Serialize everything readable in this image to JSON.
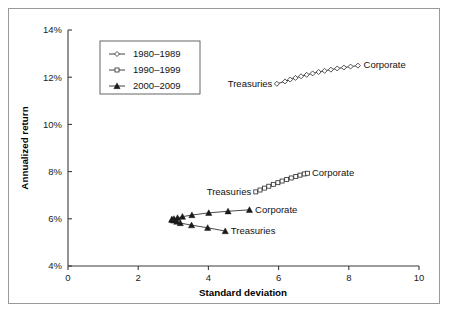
{
  "chart_data": {
    "type": "scatter",
    "title": "",
    "xlabel": "Standard deviation",
    "ylabel": "Annualized return",
    "xlim": [
      0,
      10
    ],
    "ylim": [
      4,
      14
    ],
    "xticks": [
      "0",
      "2",
      "4",
      "6",
      "8",
      "10"
    ],
    "xtick_values": [
      0,
      2,
      4,
      6,
      8,
      10
    ],
    "yticks": [
      "4%",
      "6%",
      "8%",
      "10%",
      "12%",
      "14%"
    ],
    "ytick_values": [
      4,
      6,
      8,
      10,
      12,
      14
    ],
    "grid": false,
    "legend_position": "upper left",
    "legend_entries": [
      "1980–1989",
      "1990–1999",
      "2000–2009"
    ],
    "series": [
      {
        "name": "1980–1989",
        "marker": "diamond-open",
        "start_label": "Treasuries",
        "end_label": "Corporate",
        "x": [
          5.95,
          6.18,
          6.33,
          6.48,
          6.64,
          6.8,
          6.97,
          7.14,
          7.31,
          7.49,
          7.67,
          7.86,
          8.05,
          8.26
        ],
        "y": [
          11.72,
          11.82,
          11.9,
          11.97,
          12.04,
          12.1,
          12.16,
          12.22,
          12.27,
          12.32,
          12.37,
          12.41,
          12.45,
          12.49
        ]
      },
      {
        "name": "1990–1999",
        "marker": "square-open",
        "start_label": "Treasuries",
        "end_label": "Corporate",
        "x": [
          5.35,
          5.47,
          5.6,
          5.72,
          5.85,
          5.98,
          6.1,
          6.23,
          6.36,
          6.49,
          6.61,
          6.73,
          6.82
        ],
        "y": [
          7.14,
          7.22,
          7.3,
          7.38,
          7.46,
          7.53,
          7.6,
          7.67,
          7.73,
          7.79,
          7.85,
          7.9,
          7.93
        ]
      },
      {
        "name": "2000–2009 Corporate",
        "marker": "triangle-solid",
        "start_label": "",
        "end_label": "Corporate",
        "x": [
          2.96,
          3.02,
          3.12,
          3.26,
          3.53,
          4.01,
          4.56,
          5.17
        ],
        "y": [
          5.97,
          6.0,
          6.04,
          6.09,
          6.16,
          6.25,
          6.32,
          6.38
        ]
      },
      {
        "name": "2000–2009 Treasuries",
        "marker": "triangle-solid",
        "start_label": "",
        "end_label": "Treasuries",
        "x": [
          2.96,
          3.01,
          3.1,
          3.2,
          3.52,
          3.98,
          4.48
        ],
        "y": [
          5.97,
          5.93,
          5.88,
          5.82,
          5.73,
          5.62,
          5.48
        ]
      }
    ],
    "annotations": [
      {
        "text": "Treasuries",
        "series": "1980–1989",
        "anchor": "end",
        "x": 5.82,
        "y": 11.72
      },
      {
        "text": "Corporate",
        "series": "1980–1989",
        "anchor": "start",
        "x": 8.42,
        "y": 12.53
      },
      {
        "text": "Treasuries",
        "series": "1990–1999",
        "anchor": "end",
        "x": 5.22,
        "y": 7.14
      },
      {
        "text": "Corporate",
        "series": "1990–1999",
        "anchor": "start",
        "x": 6.95,
        "y": 7.96
      },
      {
        "text": "Corporate",
        "series": "2000–2009 Corporate",
        "anchor": "start",
        "x": 5.33,
        "y": 6.38
      },
      {
        "text": "Treasuries",
        "series": "2000–2009 Treasuries",
        "anchor": "start",
        "x": 4.64,
        "y": 5.48
      }
    ]
  },
  "colors": {
    "axis": "#3b3b3b",
    "series": "#2b2b2b",
    "marker_fill": "#ffffff",
    "marker_solid": "#1a1a1a",
    "frame": "#9a9a9a",
    "background": "#ffffff"
  },
  "geometry": {
    "plot_left": 68,
    "plot_right": 419,
    "plot_top": 30,
    "plot_bottom": 266
  }
}
